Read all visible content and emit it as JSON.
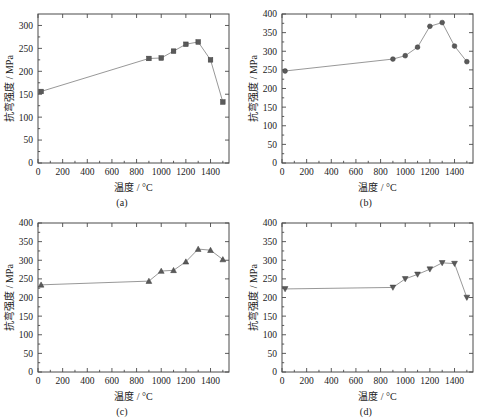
{
  "figure": {
    "background_color": "#ffffff",
    "line_color": "#8c8c8c",
    "marker_color": "#5a5a5a",
    "axis_color": "#4a4a4a",
    "panel_count": 4
  },
  "chart_data": [
    {
      "type": "line",
      "panel": "a",
      "caption": "(a)",
      "title": "",
      "xlabel": "温度 / °C",
      "ylabel": "抗弯强度 / MPa",
      "marker": "square",
      "xlim": [
        0,
        1550
      ],
      "ylim": [
        0,
        325
      ],
      "xticks": [
        0,
        200,
        400,
        600,
        800,
        1000,
        1200,
        1400
      ],
      "yticks": [
        0,
        50,
        100,
        150,
        200,
        250,
        300
      ],
      "grid": false,
      "legend": "none",
      "x": [
        25,
        900,
        1000,
        1100,
        1200,
        1300,
        1400,
        1500
      ],
      "y": [
        156,
        228,
        229,
        244,
        259,
        264,
        225,
        133
      ]
    },
    {
      "type": "line",
      "panel": "b",
      "caption": "(b)",
      "title": "",
      "xlabel": "温度 / °C",
      "ylabel": "抗弯强度 / MPa",
      "marker": "circle",
      "xlim": [
        0,
        1550
      ],
      "ylim": [
        0,
        400
      ],
      "xticks": [
        0,
        200,
        400,
        600,
        800,
        1000,
        1200,
        1400
      ],
      "yticks": [
        0,
        50,
        100,
        150,
        200,
        250,
        300,
        350,
        400
      ],
      "grid": false,
      "legend": "none",
      "x": [
        25,
        900,
        1000,
        1100,
        1200,
        1300,
        1400,
        1500
      ],
      "y": [
        247,
        279,
        288,
        311,
        367,
        377,
        314,
        272
      ]
    },
    {
      "type": "line",
      "panel": "c",
      "caption": "(c)",
      "title": "",
      "xlabel": "温度 / °C",
      "ylabel": "抗弯强度 / MPa",
      "marker": "triangle-up",
      "xlim": [
        0,
        1550
      ],
      "ylim": [
        0,
        400
      ],
      "xticks": [
        0,
        200,
        400,
        600,
        800,
        1000,
        1200,
        1400
      ],
      "yticks": [
        0,
        50,
        100,
        150,
        200,
        250,
        300,
        350,
        400
      ],
      "grid": false,
      "legend": "none",
      "x": [
        25,
        900,
        1000,
        1100,
        1200,
        1300,
        1400,
        1500
      ],
      "y": [
        234,
        244,
        271,
        273,
        296,
        330,
        327,
        302
      ]
    },
    {
      "type": "line",
      "panel": "d",
      "caption": "(d)",
      "title": "",
      "xlabel": "温度 / °C",
      "ylabel": "抗弯强度 / MPa",
      "marker": "triangle-down",
      "xlim": [
        0,
        1550
      ],
      "ylim": [
        0,
        400
      ],
      "xticks": [
        0,
        200,
        400,
        600,
        800,
        1000,
        1200,
        1400
      ],
      "yticks": [
        0,
        50,
        100,
        150,
        200,
        250,
        300,
        350,
        400
      ],
      "grid": false,
      "legend": "none",
      "x": [
        25,
        900,
        1000,
        1100,
        1200,
        1300,
        1400,
        1500
      ],
      "y": [
        223,
        227,
        250,
        262,
        276,
        293,
        291,
        200
      ]
    }
  ]
}
